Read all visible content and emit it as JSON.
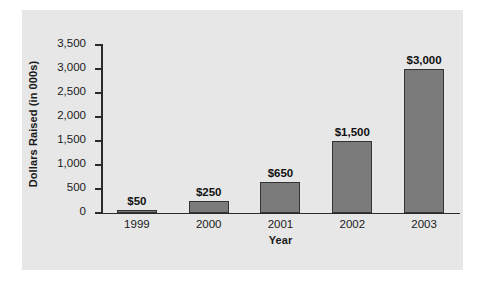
{
  "chart_data": {
    "type": "bar",
    "title": "",
    "xlabel": "Year",
    "ylabel": "Dollars Raised (in 000s)",
    "categories": [
      "1999",
      "2000",
      "2001",
      "2002",
      "2003"
    ],
    "values": [
      50,
      250,
      650,
      1500,
      3000
    ],
    "data_labels": [
      "$50",
      "$250",
      "$650",
      "$1,500",
      "$3,000"
    ],
    "ylim": [
      0,
      3500
    ],
    "ytick_values": [
      0,
      500,
      1000,
      1500,
      2000,
      2500,
      3000,
      3500
    ],
    "ytick_labels": [
      "0",
      "500",
      "1,000",
      "1,500",
      "2,000",
      "2,500",
      "3,000",
      "3,500"
    ],
    "grid": false,
    "legend": false,
    "series": [
      {
        "name": "Dollars Raised",
        "values": [
          50,
          250,
          650,
          1500,
          3000
        ]
      }
    ],
    "colors": {
      "bar_fill": "#7b7b7b",
      "bar_border": "#333333",
      "panel_background": "#e7e7e7",
      "axis": "#2b2b2b",
      "text": "#1a1a1a",
      "page_background": "#ffffff"
    }
  }
}
